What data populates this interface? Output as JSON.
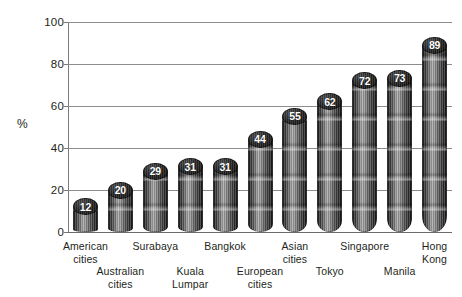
{
  "chart_data": {
    "type": "bar",
    "title": "",
    "subtitle": "",
    "xlabel": "",
    "ylabel": "%",
    "ylim": [
      0,
      100
    ],
    "yticks": [
      0,
      20,
      40,
      60,
      80,
      100
    ],
    "grid": true,
    "legend": null,
    "orientation": "vertical",
    "bar_style": "3d-cylinder",
    "data_labels": true,
    "data_label_position": "top-of-cylinder",
    "categories": [
      "American cities",
      "Australian cities",
      "Surabaya",
      "Kuala Lumpar",
      "Bangkok",
      "European cities",
      "Asian cities",
      "Tokyo",
      "Singapore",
      "Manila",
      "Hong Kong"
    ],
    "values": [
      12,
      20,
      29,
      31,
      31,
      44,
      55,
      62,
      72,
      73,
      89
    ],
    "series": [
      {
        "name": "",
        "values": [
          12,
          20,
          29,
          31,
          31,
          44,
          55,
          62,
          72,
          73,
          89
        ]
      }
    ]
  },
  "axis": {
    "y_title": "%",
    "y_ticks": [
      "100",
      "80",
      "60",
      "40",
      "20",
      "0"
    ]
  },
  "categories_rows": [
    {
      "lines": [
        "American",
        "cities"
      ],
      "row": "top"
    },
    {
      "lines": [
        "Australian",
        "cities"
      ],
      "row": "bot"
    },
    {
      "lines": [
        "Surabaya"
      ],
      "row": "top"
    },
    {
      "lines": [
        "Kuala",
        "Lumpar"
      ],
      "row": "bot"
    },
    {
      "lines": [
        "Bangkok"
      ],
      "row": "top"
    },
    {
      "lines": [
        "European",
        "cities"
      ],
      "row": "bot"
    },
    {
      "lines": [
        "Asian",
        "cities"
      ],
      "row": "top"
    },
    {
      "lines": [
        "Tokyo"
      ],
      "row": "bot"
    },
    {
      "lines": [
        "Singapore"
      ],
      "row": "top"
    },
    {
      "lines": [
        "Manila"
      ],
      "row": "bot"
    },
    {
      "lines": [
        "Hong",
        "Kong"
      ],
      "row": "top"
    }
  ],
  "colors": {
    "background": "#ffffff",
    "text": "#231f20",
    "gridline": "#8d8d8d",
    "axis": "#7a7a7a",
    "bar_dark": "#121212",
    "bar_light": "#a9a9a9",
    "value_label": "#ffffff"
  }
}
